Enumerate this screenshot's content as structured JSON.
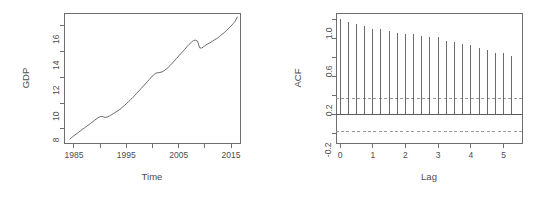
{
  "figure": {
    "width": 549,
    "height": 197,
    "background": "#ffffff",
    "line_color": "#5a5a5a",
    "axis_color": "#6e6e6e",
    "text_color": "#4d4d4d",
    "ci_color": "#8c8c8c",
    "panels": [
      "gdp-time-series",
      "acf-correlogram"
    ]
  },
  "chart_data": [
    {
      "type": "line",
      "id": "gdp-time-series",
      "title": "",
      "xlabel": "Time",
      "ylabel": "GDP",
      "xlim": [
        1983.0,
        2016.8
      ],
      "ylim": [
        6.85,
        17.05
      ],
      "grid": false,
      "legend": null,
      "xticks": [
        1985,
        1990,
        1995,
        2000,
        2005,
        2010,
        2015
      ],
      "xticklabels": [
        "1985",
        "",
        "1995",
        "",
        "2005",
        "",
        "2015"
      ],
      "yticks": [
        8,
        10,
        12,
        14,
        16
      ],
      "yticklabels": [
        "8",
        "10",
        "12",
        "14",
        "16"
      ],
      "series": [
        {
          "name": "GDP",
          "x": [
            1984.2,
            1984.6,
            1985.0,
            1985.4,
            1985.8,
            1986.2,
            1986.6,
            1987.0,
            1987.4,
            1987.8,
            1988.2,
            1988.6,
            1989.0,
            1989.4,
            1989.8,
            1990.2,
            1990.6,
            1991.0,
            1991.4,
            1991.8,
            1992.2,
            1992.6,
            1993.0,
            1993.4,
            1993.8,
            1994.2,
            1994.6,
            1995.0,
            1995.4,
            1995.8,
            1996.2,
            1996.6,
            1997.0,
            1997.4,
            1997.8,
            1998.2,
            1998.6,
            1999.0,
            1999.4,
            1999.8,
            2000.2,
            2000.6,
            2001.0,
            2001.4,
            2001.8,
            2002.2,
            2002.6,
            2003.0,
            2003.4,
            2003.8,
            2004.2,
            2004.6,
            2005.0,
            2005.4,
            2005.8,
            2006.2,
            2006.6,
            2007.0,
            2007.4,
            2007.8,
            2008.2,
            2008.6,
            2009.0,
            2009.4,
            2009.8,
            2010.2,
            2010.6,
            2011.0,
            2011.4,
            2011.8,
            2012.2,
            2012.6,
            2013.0,
            2013.4,
            2013.8,
            2014.2,
            2014.6,
            2015.0,
            2015.4,
            2015.8,
            2016.2
          ],
          "y": [
            7.2,
            7.33,
            7.46,
            7.58,
            7.7,
            7.82,
            7.95,
            8.06,
            8.18,
            8.3,
            8.42,
            8.55,
            8.68,
            8.8,
            8.9,
            8.96,
            8.93,
            8.88,
            8.92,
            9.0,
            9.1,
            9.2,
            9.3,
            9.4,
            9.52,
            9.66,
            9.8,
            9.95,
            10.1,
            10.26,
            10.42,
            10.58,
            10.76,
            10.94,
            11.12,
            11.3,
            11.48,
            11.66,
            11.84,
            12.02,
            12.2,
            12.32,
            12.36,
            12.38,
            12.42,
            12.52,
            12.64,
            12.78,
            12.94,
            13.12,
            13.3,
            13.48,
            13.66,
            13.84,
            14.02,
            14.2,
            14.4,
            14.58,
            14.72,
            14.86,
            14.9,
            14.82,
            14.3,
            14.28,
            14.4,
            14.52,
            14.62,
            14.7,
            14.8,
            14.92,
            15.0,
            15.12,
            15.26,
            15.38,
            15.52,
            15.68,
            15.84,
            16.0,
            16.18,
            16.38,
            16.7
          ]
        }
      ]
    },
    {
      "type": "bar",
      "id": "acf-correlogram",
      "title": "",
      "xlabel": "Lag",
      "ylabel": "ACF",
      "xlim": [
        -0.14,
        5.58
      ],
      "ylim": [
        -0.3,
        1.07
      ],
      "grid": false,
      "legend": null,
      "xticks": [
        0,
        1,
        2,
        3,
        4,
        5
      ],
      "xticklabels": [
        "0",
        "1",
        "2",
        "3",
        "4",
        "5"
      ],
      "yticks": [
        -0.2,
        0.2,
        0.6,
        1.0
      ],
      "yticklabels": [
        "-0.2",
        "0.2",
        "0.6",
        "1.0"
      ],
      "minor_yticks": [
        0.0,
        0.4,
        0.8
      ],
      "baseline": 0,
      "confidence_bands": [
        0.17,
        -0.17
      ],
      "confidence_style": "dashed",
      "categories": [
        0.0,
        0.25,
        0.5,
        0.75,
        1.0,
        1.25,
        1.5,
        1.75,
        2.0,
        2.25,
        2.5,
        2.75,
        3.0,
        3.25,
        3.5,
        3.75,
        4.0,
        4.25,
        4.5,
        4.75,
        5.0,
        5.25
      ],
      "values": [
        1.0,
        0.975,
        0.95,
        0.925,
        0.9,
        0.895,
        0.875,
        0.855,
        0.845,
        0.845,
        0.825,
        0.815,
        0.815,
        0.775,
        0.765,
        0.745,
        0.725,
        0.695,
        0.675,
        0.645,
        0.645,
        0.615
      ]
    }
  ],
  "labels": {
    "gdp_y_axis": "GDP",
    "gdp_x_axis": "Time",
    "acf_y_axis": "ACF",
    "acf_x_axis": "Lag"
  }
}
